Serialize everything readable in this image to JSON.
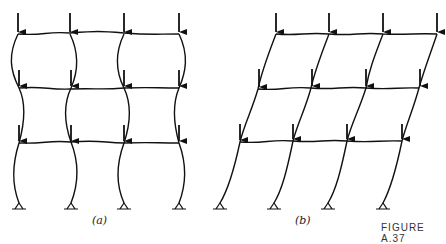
{
  "figure": {
    "caption": "FIGURE A.37",
    "panels": [
      {
        "label": "(a)",
        "description": "Symmetric buckling of three-bay, three-story frame under gravity loads"
      },
      {
        "label": "(b)",
        "description": "Sidesway buckling of three-bay, three-story frame under gravity loads"
      }
    ]
  }
}
